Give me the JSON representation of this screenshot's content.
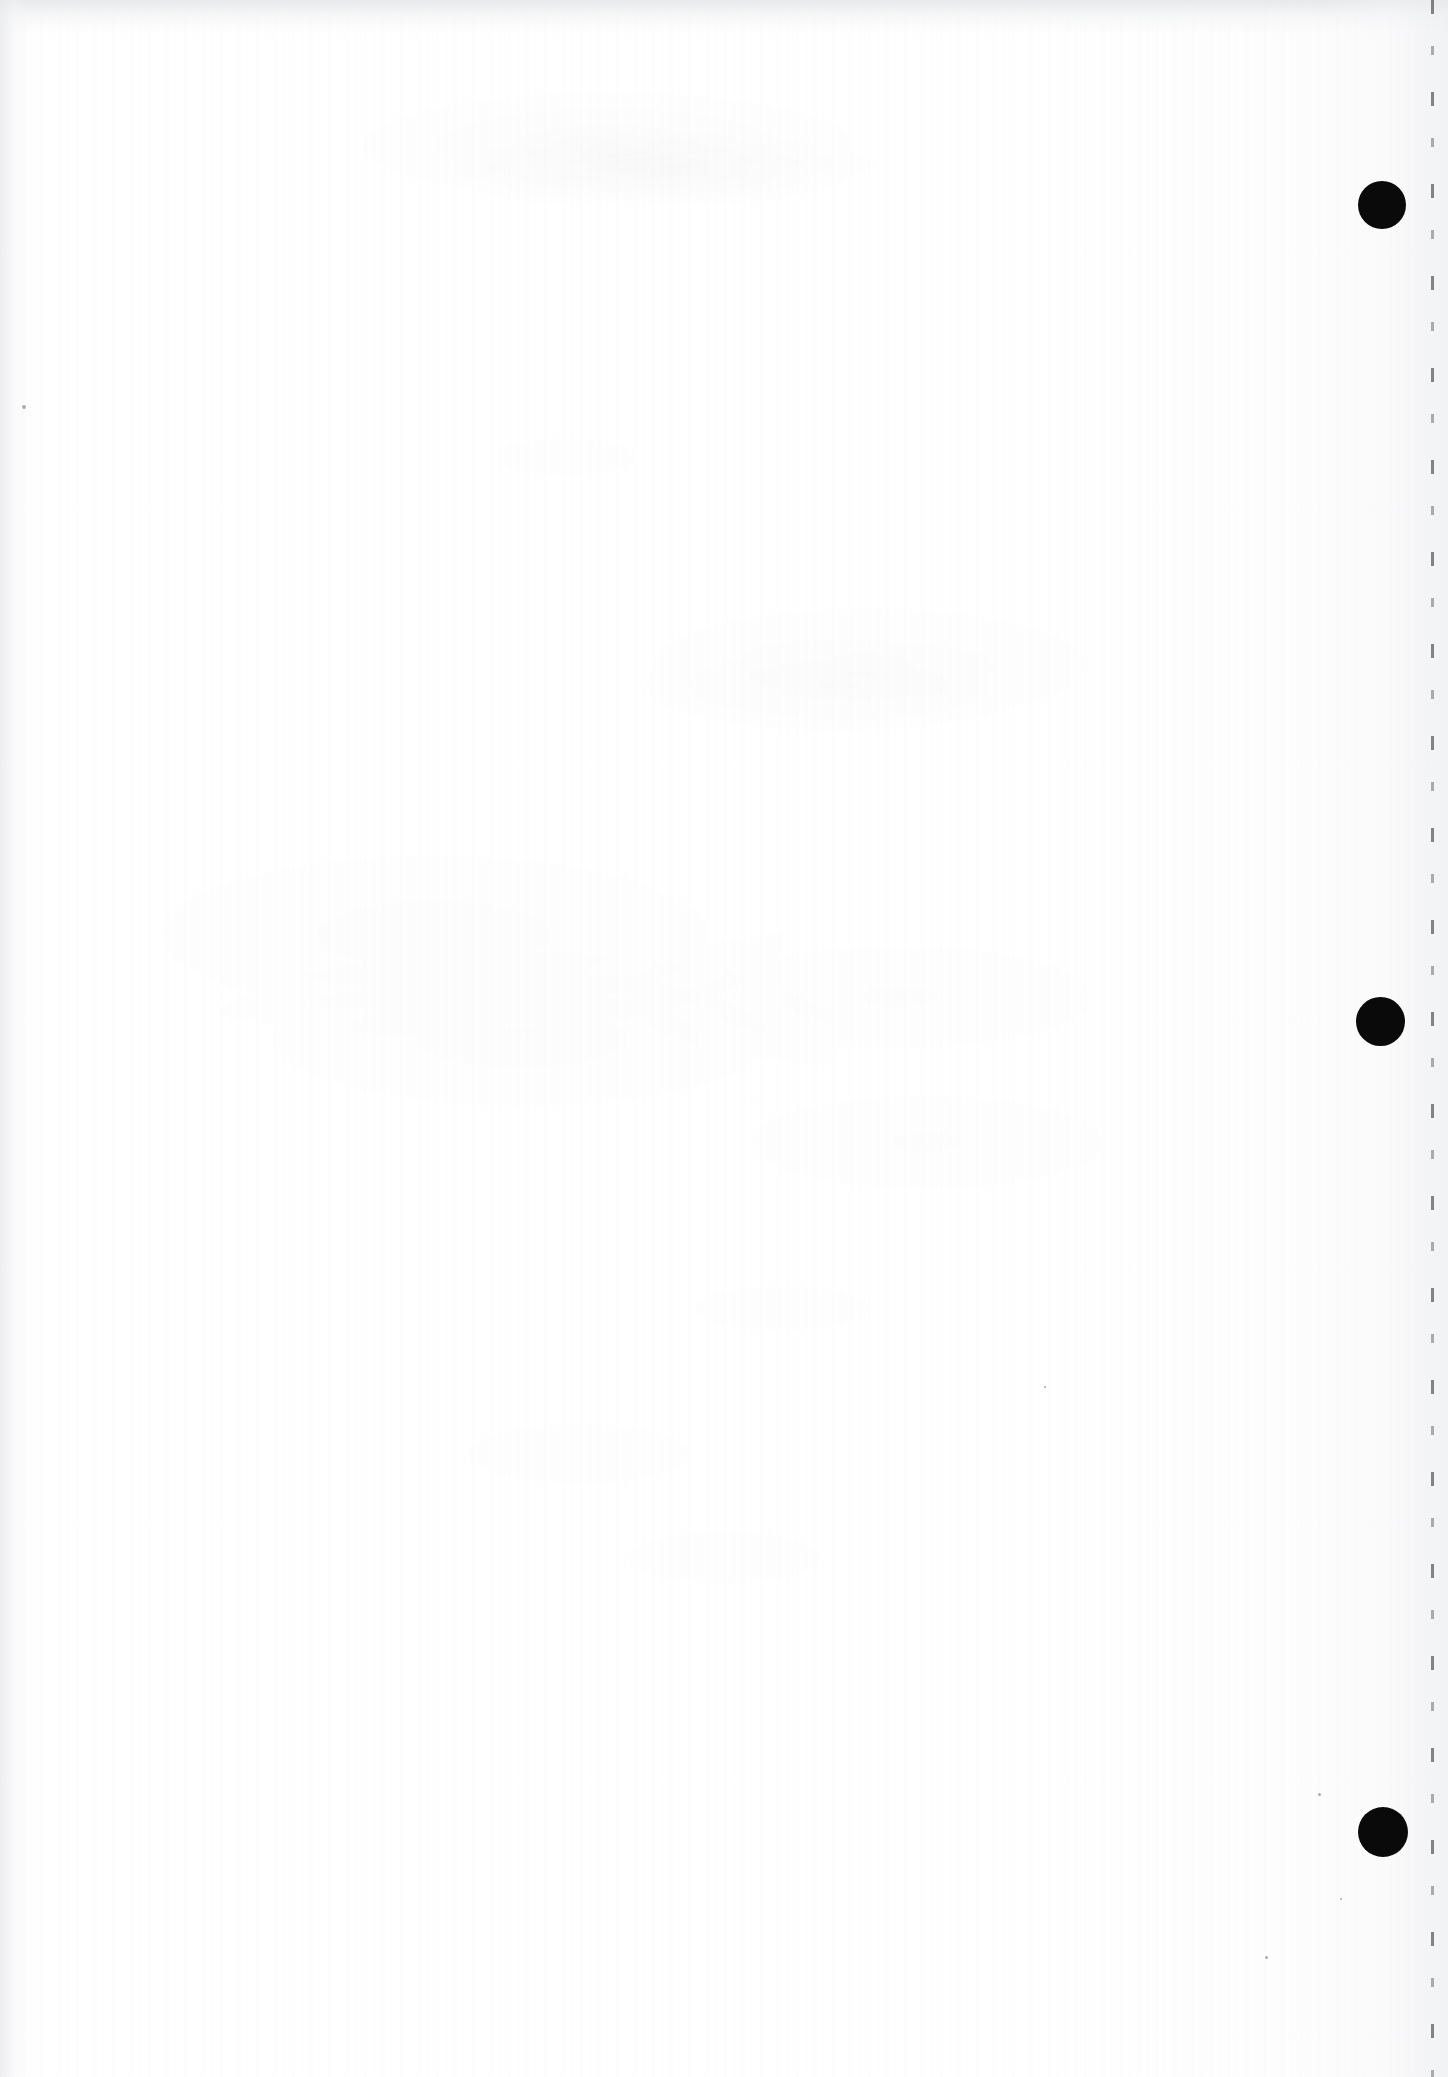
{
  "page": {
    "kind": "scanned-blank-page",
    "width": 1448,
    "height": 2077,
    "background_color": "#fefefe",
    "paper_color": "#ffffff",
    "visible_text": "",
    "note": "Blank scanned document sheet; no legible printed text is rendered in the pixels."
  },
  "marks": {
    "ink_color": "#0a0a0a",
    "register_marks": [
      {
        "label": "register-mark-top",
        "cx": 1382,
        "cy": 205,
        "diameter": 48
      },
      {
        "label": "register-mark-middle",
        "cx": 1380,
        "cy": 1021,
        "diameter": 49
      },
      {
        "label": "register-mark-bottom",
        "cx": 1383,
        "cy": 1832,
        "diameter": 50
      }
    ],
    "margin_rule": {
      "label": "right-margin-broken-rule",
      "x": 1431,
      "color": "#3c3c42",
      "style": "broken-dashed",
      "orientation": "vertical"
    },
    "specks": [
      {
        "x": 22,
        "y": 405,
        "size": 4
      },
      {
        "x": 1265,
        "y": 1956,
        "size": 3
      },
      {
        "x": 1318,
        "y": 1793,
        "size": 3
      },
      {
        "x": 1340,
        "y": 1898,
        "size": 2
      },
      {
        "x": 1044,
        "y": 1386,
        "size": 2
      }
    ]
  },
  "artifacts": {
    "top_edge_band": "grey scan band along the top edge",
    "left_edge_band": "grey scan band along the left edge",
    "right_edge_band": "grey tone along the right edge",
    "paper_grain": "fine vertical paper grain / scanner streaking",
    "show_through": "faint illegible ghosting of text from the reverse side of the sheet"
  }
}
